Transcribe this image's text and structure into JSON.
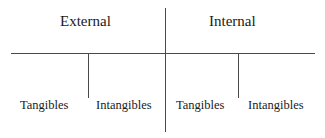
{
  "diagram": {
    "type": "classification-tree",
    "background_color": "#ffffff",
    "line_color": "#4a4a4a",
    "text_color": "#1a1a1a",
    "branches": [
      {
        "id": "external",
        "heading": "External",
        "children": [
          {
            "id": "external-tangibles",
            "label": "Tangibles"
          },
          {
            "id": "external-intangibles",
            "label": "Intangibles"
          }
        ]
      },
      {
        "id": "internal",
        "heading": "Internal",
        "children": [
          {
            "id": "internal-tangibles",
            "label": "Tangibles"
          },
          {
            "id": "internal-intangibles",
            "label": "Intangibles"
          }
        ]
      }
    ]
  }
}
